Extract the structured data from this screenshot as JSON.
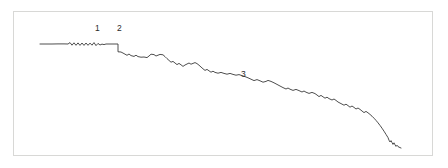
{
  "figure": {
    "background_color": "#ffffff",
    "frame": {
      "border_color": "#d8d8d6",
      "x": 13,
      "y": 11,
      "width": 420,
      "height": 145
    },
    "line_color": "#3a3a3a"
  },
  "annotations": [
    {
      "label": "1",
      "x": 95,
      "y": 24
    },
    {
      "label": "2",
      "x": 117,
      "y": 24
    },
    {
      "label": "3",
      "x": 241,
      "y": 70
    }
  ],
  "chart_data": {
    "type": "line",
    "title": "",
    "subtitle": "",
    "xlabel": "",
    "ylabel": "",
    "grid": false,
    "legend": false,
    "axes_visible": false,
    "xlim": [
      40,
      401
    ],
    "ylim": [
      148,
      43
    ],
    "annotation_labels": [
      "1",
      "2",
      "3"
    ],
    "series": [
      {
        "name": "trace",
        "color": "#3a3a3a",
        "points": [
          [
            40,
            44.0
          ],
          [
            46,
            44.0
          ],
          [
            52,
            44.0
          ],
          [
            58,
            43.9
          ],
          [
            64,
            43.9
          ],
          [
            68,
            44.0
          ],
          [
            70,
            42.6
          ],
          [
            72,
            45.2
          ],
          [
            74,
            42.8
          ],
          [
            76,
            45.3
          ],
          [
            78,
            42.9
          ],
          [
            80,
            45.4
          ],
          [
            82,
            43.0
          ],
          [
            84,
            45.4
          ],
          [
            86,
            43.0
          ],
          [
            88,
            45.3
          ],
          [
            90,
            43.1
          ],
          [
            92,
            45.2
          ],
          [
            94,
            42.6
          ],
          [
            96,
            45.6
          ],
          [
            98,
            43.4
          ],
          [
            100,
            45.0
          ],
          [
            102,
            44.1
          ],
          [
            104,
            44.6
          ],
          [
            106,
            44.0
          ],
          [
            109,
            44.0
          ],
          [
            112,
            44.0
          ],
          [
            115,
            44.0
          ],
          [
            118,
            44.0
          ],
          [
            118,
            51.8
          ],
          [
            121,
            52.0
          ],
          [
            124,
            53.6
          ],
          [
            127,
            55.3
          ],
          [
            129,
            54.0
          ],
          [
            131,
            55.6
          ],
          [
            134,
            56.4
          ],
          [
            136,
            55.2
          ],
          [
            138,
            56.6
          ],
          [
            141,
            57.2
          ],
          [
            144,
            57.0
          ],
          [
            147,
            57.6
          ],
          [
            149,
            56.0
          ],
          [
            151,
            54.2
          ],
          [
            154,
            54.6
          ],
          [
            156,
            56.0
          ],
          [
            158,
            55.2
          ],
          [
            160,
            54.4
          ],
          [
            163,
            54.8
          ],
          [
            165,
            56.6
          ],
          [
            167,
            58.6
          ],
          [
            169,
            60.4
          ],
          [
            171,
            62.2
          ],
          [
            173,
            61.4
          ],
          [
            175,
            63.0
          ],
          [
            177,
            64.6
          ],
          [
            179,
            63.4
          ],
          [
            181,
            64.8
          ],
          [
            183,
            66.4
          ],
          [
            185,
            65.0
          ],
          [
            187,
            64.0
          ],
          [
            189,
            63.0
          ],
          [
            191,
            64.2
          ],
          [
            193,
            63.4
          ],
          [
            195,
            62.6
          ],
          [
            197,
            63.6
          ],
          [
            199,
            65.2
          ],
          [
            201,
            67.0
          ],
          [
            203,
            68.8
          ],
          [
            205,
            70.4
          ],
          [
            207,
            69.4
          ],
          [
            209,
            70.8
          ],
          [
            211,
            72.2
          ],
          [
            213,
            71.2
          ],
          [
            215,
            72.4
          ],
          [
            218,
            73.2
          ],
          [
            221,
            72.4
          ],
          [
            224,
            73.4
          ],
          [
            227,
            74.2
          ],
          [
            230,
            73.4
          ],
          [
            233,
            74.4
          ],
          [
            236,
            75.2
          ],
          [
            239,
            74.6
          ],
          [
            242,
            75.6
          ],
          [
            245,
            76.6
          ],
          [
            248,
            77.8
          ],
          [
            251,
            79.2
          ],
          [
            254,
            80.6
          ],
          [
            257,
            79.6
          ],
          [
            260,
            80.8
          ],
          [
            263,
            82.2
          ],
          [
            266,
            81.4
          ],
          [
            268,
            80.4
          ],
          [
            271,
            81.4
          ],
          [
            274,
            82.8
          ],
          [
            277,
            84.4
          ],
          [
            280,
            86.0
          ],
          [
            283,
            87.6
          ],
          [
            286,
            89.0
          ],
          [
            288,
            88.0
          ],
          [
            290,
            89.2
          ],
          [
            293,
            90.4
          ],
          [
            296,
            89.4
          ],
          [
            299,
            90.6
          ],
          [
            302,
            92.0
          ],
          [
            304,
            91.0
          ],
          [
            306,
            92.2
          ],
          [
            309,
            93.4
          ],
          [
            312,
            92.4
          ],
          [
            315,
            93.6
          ],
          [
            317,
            95.0
          ],
          [
            319,
            96.6
          ],
          [
            321,
            95.4
          ],
          [
            323,
            96.8
          ],
          [
            325,
            98.2
          ],
          [
            327,
            97.2
          ],
          [
            329,
            98.6
          ],
          [
            332,
            100.0
          ],
          [
            334,
            99.0
          ],
          [
            336,
            100.4
          ],
          [
            338,
            102.0
          ],
          [
            341,
            103.6
          ],
          [
            344,
            105.2
          ],
          [
            346,
            104.2
          ],
          [
            348,
            105.6
          ],
          [
            350,
            107.2
          ],
          [
            352,
            106.0
          ],
          [
            354,
            107.4
          ],
          [
            356,
            109.0
          ],
          [
            358,
            108.0
          ],
          [
            360,
            109.4
          ],
          [
            362,
            111.0
          ],
          [
            364,
            112.6
          ],
          [
            366,
            111.4
          ],
          [
            368,
            112.8
          ],
          [
            370,
            114.4
          ],
          [
            372,
            116.2
          ],
          [
            374,
            118.2
          ],
          [
            376,
            120.4
          ],
          [
            378,
            122.8
          ],
          [
            380,
            125.4
          ],
          [
            382,
            128.2
          ],
          [
            384,
            131.2
          ],
          [
            386,
            134.4
          ],
          [
            388,
            137.6
          ],
          [
            389,
            140.2
          ],
          [
            390,
            142.0
          ],
          [
            391,
            140.6
          ],
          [
            392,
            142.6
          ],
          [
            393,
            144.4
          ],
          [
            394,
            142.8
          ],
          [
            395,
            144.8
          ],
          [
            396,
            146.4
          ],
          [
            397,
            145.2
          ],
          [
            398,
            146.6
          ],
          [
            400,
            147.6
          ],
          [
            401,
            148.0
          ]
        ]
      }
    ]
  }
}
